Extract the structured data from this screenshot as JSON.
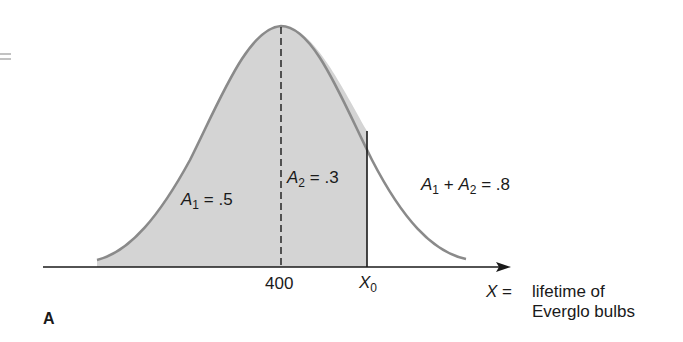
{
  "figure": {
    "panel_label": "A",
    "left_margin_mark": "=",
    "distribution": "normal",
    "fill_color": "#d4d4d4",
    "curve_color": "#8a8a8a",
    "axis": {
      "tick_mean": "400",
      "tick_x0_var": "X",
      "tick_x0_sub": "0",
      "label_var": "X",
      "label_eq": "=",
      "label_line1": "lifetime of",
      "label_line2": "Everglo bulbs"
    },
    "regions": {
      "a1": {
        "var": "A",
        "sub": "1",
        "text": "= .5"
      },
      "a2": {
        "var": "A",
        "sub": "2",
        "text": "= .3"
      },
      "sum": {
        "var1": "A",
        "sub1": "1",
        "plus": "+",
        "var2": "A",
        "sub2": "2",
        "text": "= .8"
      }
    }
  }
}
